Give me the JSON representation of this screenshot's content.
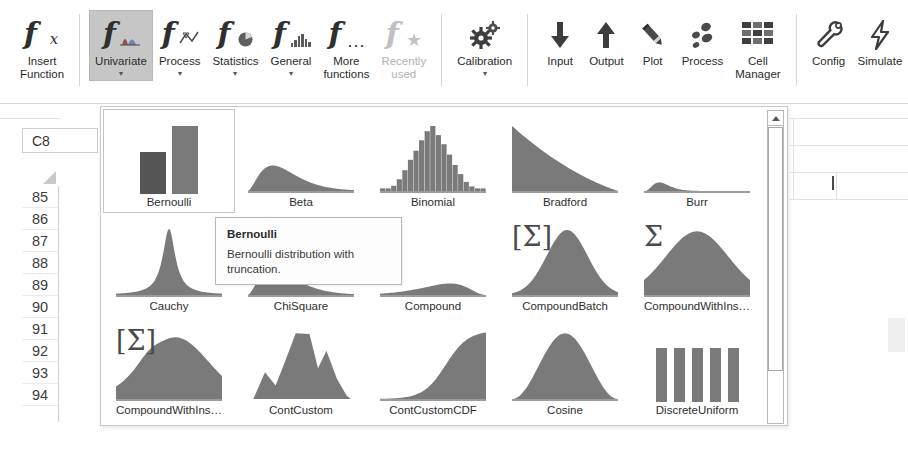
{
  "ribbon": {
    "groups": [
      {
        "name": "insert",
        "buttons": [
          {
            "label": "Insert\nFunction",
            "icon": "fx-icon",
            "state": "normal",
            "caret": false
          }
        ]
      },
      {
        "name": "function-categories",
        "buttons": [
          {
            "label": "Univariate",
            "icon": "fx-univariate-icon",
            "state": "selected",
            "caret": true
          },
          {
            "label": "Process",
            "icon": "fx-process-icon",
            "state": "normal",
            "caret": true
          },
          {
            "label": "Statistics",
            "icon": "fx-statistics-icon",
            "state": "normal",
            "caret": true
          },
          {
            "label": "General",
            "icon": "fx-general-icon",
            "state": "normal",
            "caret": true
          },
          {
            "label": "More\nfunctions",
            "icon": "fx-more-icon",
            "state": "normal",
            "caret": "inline"
          },
          {
            "label": "Recently\nused",
            "icon": "fx-recent-icon",
            "state": "disabled",
            "caret": "inline"
          }
        ]
      },
      {
        "name": "calibration",
        "buttons": [
          {
            "label": "Calibration",
            "icon": "gears-icon",
            "state": "normal",
            "caret": true
          }
        ]
      },
      {
        "name": "data",
        "buttons": [
          {
            "label": "Input",
            "icon": "arrow-down-icon",
            "state": "normal",
            "caret": false
          },
          {
            "label": "Output",
            "icon": "arrow-up-icon",
            "state": "normal",
            "caret": false
          },
          {
            "label": "Plot",
            "icon": "pencil-icon",
            "state": "normal",
            "caret": false
          },
          {
            "label": "Process",
            "icon": "scatter-icon",
            "state": "normal",
            "caret": false
          },
          {
            "label": "Cell\nManager",
            "icon": "grid-icon",
            "state": "normal",
            "caret": false
          }
        ]
      },
      {
        "name": "tools",
        "buttons": [
          {
            "label": "Config",
            "icon": "wrench-icon",
            "state": "normal",
            "caret": false
          },
          {
            "label": "Simulate",
            "icon": "lightning-icon",
            "state": "normal",
            "caret": false
          }
        ]
      }
    ]
  },
  "sheet": {
    "name_box_value": "C8",
    "row_headers": [
      "85",
      "86",
      "87",
      "88",
      "89",
      "90",
      "91",
      "92",
      "93",
      "94"
    ]
  },
  "gallery": {
    "name": "univariate-distribution-gallery",
    "tiles": [
      {
        "label": "Bernoulli",
        "shape": "bars2",
        "sigma": "",
        "selected": true
      },
      {
        "label": "Beta",
        "shape": "rightskew",
        "sigma": "",
        "selected": false
      },
      {
        "label": "Binomial",
        "shape": "histogram",
        "sigma": "",
        "selected": false
      },
      {
        "label": "Bradford",
        "shape": "decay",
        "sigma": "",
        "selected": false
      },
      {
        "label": "Burr",
        "shape": "spikeskew",
        "sigma": "",
        "selected": false
      },
      {
        "label": "Cauchy",
        "shape": "peaky",
        "sigma": "",
        "selected": false
      },
      {
        "label": "ChiSquare",
        "shape": "rightskew",
        "sigma": "",
        "selected": false
      },
      {
        "label": "Compound",
        "shape": "leftskew",
        "sigma": "",
        "selected": false
      },
      {
        "label": "CompoundBatch",
        "shape": "normal",
        "sigma": "[Σ]",
        "selected": false
      },
      {
        "label": "CompoundWithIns…",
        "shape": "wide",
        "sigma": "Σ",
        "selected": false
      },
      {
        "label": "CompoundWithIns…",
        "shape": "humpy",
        "sigma": "[Σ]",
        "selected": false
      },
      {
        "label": "ContCustom",
        "shape": "multimodal",
        "sigma": "",
        "selected": false
      },
      {
        "label": "ContCustomCDF",
        "shape": "cdf",
        "sigma": "",
        "selected": false
      },
      {
        "label": "Cosine",
        "shape": "cosine",
        "sigma": "",
        "selected": false
      },
      {
        "label": "DiscreteUniform",
        "shape": "bars5",
        "sigma": "",
        "selected": false
      }
    ],
    "scrollbar": {
      "up_arrow": "scroll-up-arrow",
      "thumb_position_percent": 5
    }
  },
  "tooltip": {
    "title": "Bernoulli",
    "body": "Bernoulli distribution with truncation."
  },
  "colors": {
    "chart_fill": "#7a7a7a",
    "chart_fill_dark": "#565656",
    "selected_button_bg": "#c6c6c6",
    "disabled_text": "#b2b2b2",
    "border": "#c8c8c8"
  }
}
